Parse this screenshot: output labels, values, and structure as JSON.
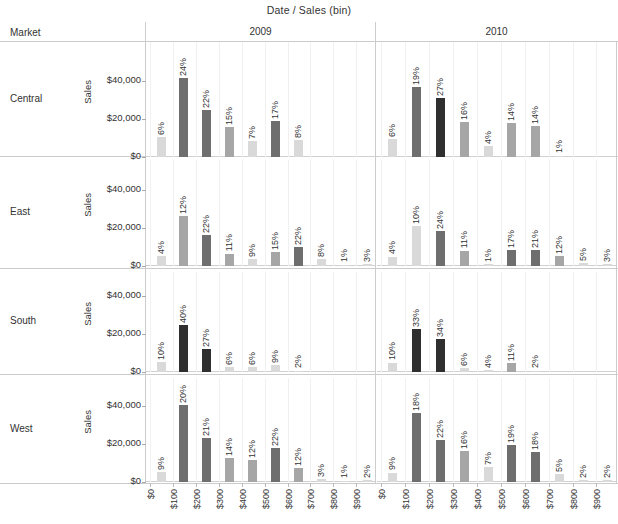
{
  "chart_title": {
    "field_date": "Date",
    "separator": "/",
    "field_bin": "Sales (bin)"
  },
  "corner_header": "Market",
  "column_headers": [
    "2009",
    "2010"
  ],
  "row_headers": [
    "Central",
    "East",
    "South",
    "West"
  ],
  "axis_title": "Sales",
  "y_ticks": [
    "$0",
    "$20,000",
    "$40,000"
  ],
  "x_ticks": [
    "$0",
    "$100",
    "$200",
    "$300",
    "$400",
    "$500",
    "$600",
    "$700",
    "$800",
    "$900"
  ],
  "colors": {
    "background": "#ffffff",
    "gridline": "#f0f0f0",
    "rule": "#cccccc",
    "text": "#333333",
    "bar_light": "#d9d9d9",
    "bar_mid": "#a6a6a6",
    "bar_dark": "#6e6e6e",
    "bar_darkest": "#2f2f2f"
  },
  "chart_data": {
    "type": "bar",
    "xlabel": "Sales (bin)",
    "ylabel": "Sales",
    "ylim": [
      0,
      50000
    ],
    "y_tick_values": [
      0,
      20000,
      40000
    ],
    "grid": true,
    "legend": "none",
    "layout": "small-multiples: rows = Market, columns = Date (year)",
    "bar_labels": "percent of total sales within each panel",
    "categories": [
      "$0",
      "$100",
      "$200",
      "$300",
      "$400",
      "$500",
      "$600",
      "$700",
      "$800",
      "$900"
    ],
    "panels": [
      {
        "row": "Central",
        "column": "2009",
        "bars": [
          {
            "bin": "$0",
            "percent": "6%",
            "pct": 6,
            "sales": 10500
          },
          {
            "bin": "$100",
            "percent": "24%",
            "pct": 24,
            "sales": 41500
          },
          {
            "bin": "$200",
            "percent": "22%",
            "pct": 22,
            "sales": 24500
          },
          {
            "bin": "$300",
            "percent": "15%",
            "pct": 15,
            "sales": 16000
          },
          {
            "bin": "$400",
            "percent": "7%",
            "pct": 7,
            "sales": 8500
          },
          {
            "bin": "$500",
            "percent": "17%",
            "pct": 17,
            "sales": 19000
          },
          {
            "bin": "$600",
            "percent": "8%",
            "pct": 8,
            "sales": 9000
          },
          {
            "bin": "$700",
            "percent": "",
            "pct": 0,
            "sales": 0
          },
          {
            "bin": "$800",
            "percent": "",
            "pct": 0,
            "sales": 0
          },
          {
            "bin": "$900",
            "percent": "",
            "pct": 0,
            "sales": 0
          }
        ]
      },
      {
        "row": "Central",
        "column": "2010",
        "bars": [
          {
            "bin": "$0",
            "percent": "6%",
            "pct": 6,
            "sales": 9500
          },
          {
            "bin": "$100",
            "percent": "19%",
            "pct": 19,
            "sales": 37000
          },
          {
            "bin": "$200",
            "percent": "27%",
            "pct": 27,
            "sales": 31000
          },
          {
            "bin": "$300",
            "percent": "16%",
            "pct": 16,
            "sales": 18500
          },
          {
            "bin": "$400",
            "percent": "4%",
            "pct": 4,
            "sales": 6000
          },
          {
            "bin": "$500",
            "percent": "14%",
            "pct": 14,
            "sales": 18000
          },
          {
            "bin": "$600",
            "percent": "14%",
            "pct": 14,
            "sales": 16500
          },
          {
            "bin": "$700",
            "percent": "1%",
            "pct": 1,
            "sales": 700
          },
          {
            "bin": "$800",
            "percent": "",
            "pct": 0,
            "sales": 0
          },
          {
            "bin": "$900",
            "percent": "",
            "pct": 0,
            "sales": 0
          }
        ]
      },
      {
        "row": "East",
        "column": "2009",
        "bars": [
          {
            "bin": "$0",
            "percent": "4%",
            "pct": 4,
            "sales": 5500
          },
          {
            "bin": "$100",
            "percent": "12%",
            "pct": 12,
            "sales": 26500
          },
          {
            "bin": "$200",
            "percent": "22%",
            "pct": 22,
            "sales": 16500
          },
          {
            "bin": "$300",
            "percent": "11%",
            "pct": 11,
            "sales": 6500
          },
          {
            "bin": "$400",
            "percent": "9%",
            "pct": 9,
            "sales": 3500
          },
          {
            "bin": "$500",
            "percent": "15%",
            "pct": 15,
            "sales": 7500
          },
          {
            "bin": "$600",
            "percent": "22%",
            "pct": 22,
            "sales": 10000
          },
          {
            "bin": "$700",
            "percent": "8%",
            "pct": 8,
            "sales": 3500
          },
          {
            "bin": "$800",
            "percent": "1%",
            "pct": 1,
            "sales": 600
          },
          {
            "bin": "$900",
            "percent": "3%",
            "pct": 3,
            "sales": 900
          }
        ]
      },
      {
        "row": "East",
        "column": "2010",
        "bars": [
          {
            "bin": "$0",
            "percent": "4%",
            "pct": 4,
            "sales": 5000
          },
          {
            "bin": "$100",
            "percent": "10%",
            "pct": 10,
            "sales": 21000
          },
          {
            "bin": "$200",
            "percent": "24%",
            "pct": 24,
            "sales": 18500
          },
          {
            "bin": "$300",
            "percent": "11%",
            "pct": 11,
            "sales": 8000
          },
          {
            "bin": "$400",
            "percent": "1%",
            "pct": 1,
            "sales": 800
          },
          {
            "bin": "$500",
            "percent": "17%",
            "pct": 17,
            "sales": 8500
          },
          {
            "bin": "$600",
            "percent": "21%",
            "pct": 21,
            "sales": 8500
          },
          {
            "bin": "$700",
            "percent": "12%",
            "pct": 12,
            "sales": 5500
          },
          {
            "bin": "$800",
            "percent": "5%",
            "pct": 5,
            "sales": 1800
          },
          {
            "bin": "$900",
            "percent": "3%",
            "pct": 3,
            "sales": 1200
          }
        ]
      },
      {
        "row": "South",
        "column": "2009",
        "bars": [
          {
            "bin": "$0",
            "percent": "10%",
            "pct": 10,
            "sales": 5500
          },
          {
            "bin": "$100",
            "percent": "40%",
            "pct": 40,
            "sales": 24500
          },
          {
            "bin": "$200",
            "percent": "27%",
            "pct": 27,
            "sales": 12000
          },
          {
            "bin": "$300",
            "percent": "6%",
            "pct": 6,
            "sales": 2500
          },
          {
            "bin": "$400",
            "percent": "6%",
            "pct": 6,
            "sales": 2500
          },
          {
            "bin": "$500",
            "percent": "9%",
            "pct": 9,
            "sales": 3500
          },
          {
            "bin": "$600",
            "percent": "2%",
            "pct": 2,
            "sales": 700
          },
          {
            "bin": "$700",
            "percent": "",
            "pct": 0,
            "sales": 0
          },
          {
            "bin": "$800",
            "percent": "",
            "pct": 0,
            "sales": 0
          },
          {
            "bin": "$900",
            "percent": "",
            "pct": 0,
            "sales": 0
          }
        ]
      },
      {
        "row": "South",
        "column": "2010",
        "bars": [
          {
            "bin": "$0",
            "percent": "10%",
            "pct": 10,
            "sales": 5000
          },
          {
            "bin": "$100",
            "percent": "33%",
            "pct": 33,
            "sales": 22500
          },
          {
            "bin": "$200",
            "percent": "34%",
            "pct": 34,
            "sales": 17500
          },
          {
            "bin": "$300",
            "percent": "6%",
            "pct": 6,
            "sales": 2000
          },
          {
            "bin": "$400",
            "percent": "4%",
            "pct": 4,
            "sales": 1200
          },
          {
            "bin": "$500",
            "percent": "11%",
            "pct": 11,
            "sales": 4500
          },
          {
            "bin": "$600",
            "percent": "2%",
            "pct": 2,
            "sales": 700
          },
          {
            "bin": "$700",
            "percent": "",
            "pct": 0,
            "sales": 0
          },
          {
            "bin": "$800",
            "percent": "",
            "pct": 0,
            "sales": 0
          },
          {
            "bin": "$900",
            "percent": "",
            "pct": 0,
            "sales": 0
          }
        ]
      },
      {
        "row": "West",
        "column": "2009",
        "bars": [
          {
            "bin": "$0",
            "percent": "9%",
            "pct": 9,
            "sales": 5500
          },
          {
            "bin": "$100",
            "percent": "20%",
            "pct": 20,
            "sales": 40500
          },
          {
            "bin": "$200",
            "percent": "21%",
            "pct": 21,
            "sales": 23000
          },
          {
            "bin": "$300",
            "percent": "14%",
            "pct": 14,
            "sales": 12500
          },
          {
            "bin": "$400",
            "percent": "12%",
            "pct": 12,
            "sales": 11500
          },
          {
            "bin": "$500",
            "percent": "22%",
            "pct": 22,
            "sales": 18000
          },
          {
            "bin": "$600",
            "percent": "12%",
            "pct": 12,
            "sales": 7500
          },
          {
            "bin": "$700",
            "percent": "3%",
            "pct": 3,
            "sales": 1800
          },
          {
            "bin": "$800",
            "percent": "1%",
            "pct": 1,
            "sales": 500
          },
          {
            "bin": "$900",
            "percent": "2%",
            "pct": 2,
            "sales": 900
          }
        ]
      },
      {
        "row": "West",
        "column": "2010",
        "bars": [
          {
            "bin": "$0",
            "percent": "9%",
            "pct": 9,
            "sales": 5000
          },
          {
            "bin": "$100",
            "percent": "18%",
            "pct": 18,
            "sales": 36500
          },
          {
            "bin": "$200",
            "percent": "22%",
            "pct": 22,
            "sales": 22000
          },
          {
            "bin": "$300",
            "percent": "16%",
            "pct": 16,
            "sales": 16500
          },
          {
            "bin": "$400",
            "percent": "7%",
            "pct": 7,
            "sales": 8000
          },
          {
            "bin": "$500",
            "percent": "19%",
            "pct": 19,
            "sales": 19500
          },
          {
            "bin": "$600",
            "percent": "18%",
            "pct": 18,
            "sales": 16000
          },
          {
            "bin": "$700",
            "percent": "5%",
            "pct": 5,
            "sales": 4000
          },
          {
            "bin": "$800",
            "percent": "2%",
            "pct": 2,
            "sales": 900
          },
          {
            "bin": "$900",
            "percent": "2%",
            "pct": 2,
            "sales": 900
          }
        ]
      }
    ]
  }
}
